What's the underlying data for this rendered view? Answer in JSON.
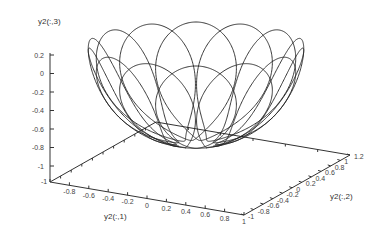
{
  "chart_data": {
    "type": "line3d",
    "title": "",
    "xlabel": "y2(:,1)",
    "ylabel": "y2(:,2)",
    "zlabel": "y2(:,3)",
    "x_ticks": [
      "-1",
      "-0.8",
      "-0.6",
      "-0.4",
      "-0.2",
      "0",
      "0.2",
      "0.4",
      "0.6",
      "0.8",
      "1"
    ],
    "y_ticks": [
      "-1",
      "-0.8",
      "-0.6",
      "-0.4",
      "-0.2",
      "0",
      "0.2",
      "0.4",
      "0.6",
      "0.8",
      "1",
      "1.2"
    ],
    "z_ticks": [
      "0.2",
      "0",
      "-0.2",
      "-0.4",
      "-0.6",
      "-0.8",
      "-1"
    ],
    "xlim": [
      -1,
      1
    ],
    "ylim": [
      -1,
      1.2
    ],
    "zlim": [
      -1,
      0.2
    ],
    "grid": false,
    "legend": null,
    "series": [
      {
        "name": "y2",
        "description": "Closed spirograph-like trajectory on lower unit hemisphere: loops sweeping from rim (z≈0) down to near bottom (z≈-0.95), about 14 petals around the bowl",
        "petals": 14,
        "rim_z": 0.0,
        "bottom_z": -0.95,
        "radius": 1.0,
        "color": "#222222"
      }
    ]
  }
}
